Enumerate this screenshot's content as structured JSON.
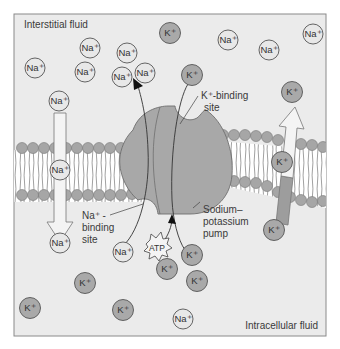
{
  "diagram": {
    "type": "sodium-potassium pump across cell membrane",
    "regions": {
      "top_label": "Interstitial fluid",
      "bottom_label": "Intracellular fluid"
    },
    "labels": {
      "k_binding_line1": "K⁺-binding",
      "k_binding_line2": "site",
      "na_binding_line1": "Na⁺ -",
      "na_binding_line2": "binding",
      "na_binding_line3": "site",
      "pump_line1": "Sodium–",
      "pump_line2": "potassium",
      "pump_line3": "pump",
      "atp": "ATP"
    },
    "ion_text": {
      "na": "Na⁺",
      "k": "K⁺"
    },
    "colors": {
      "background": "#ebebeb",
      "frame": "#8a8a8a",
      "na_fill": "#e8e8e8",
      "k_fill": "#a9a9a9",
      "pump_fill": "#a8a8a8",
      "lipid_head": "#a6a6a6",
      "arrow_light": "#f4f4f4",
      "arrow_dark": "#9d9d9d"
    },
    "ions": [
      {
        "type": "na",
        "x": 35,
        "y": 68
      },
      {
        "type": "na",
        "x": 90,
        "y": 48
      },
      {
        "type": "na",
        "x": 85,
        "y": 72
      },
      {
        "type": "na",
        "x": 127,
        "y": 53
      },
      {
        "type": "na",
        "x": 122,
        "y": 77
      },
      {
        "type": "na",
        "x": 145,
        "y": 73
      },
      {
        "type": "na",
        "x": 59,
        "y": 101
      },
      {
        "type": "k",
        "x": 170,
        "y": 33
      },
      {
        "type": "na",
        "x": 228,
        "y": 40
      },
      {
        "type": "na",
        "x": 269,
        "y": 50
      },
      {
        "type": "na",
        "x": 313,
        "y": 34
      },
      {
        "type": "k",
        "x": 192,
        "y": 75
      },
      {
        "type": "k",
        "x": 292,
        "y": 92
      },
      {
        "type": "na",
        "x": 60,
        "y": 170
      },
      {
        "type": "k",
        "x": 282,
        "y": 162
      },
      {
        "type": "na",
        "x": 60,
        "y": 243
      },
      {
        "type": "na",
        "x": 123,
        "y": 252
      },
      {
        "type": "k",
        "x": 274,
        "y": 230
      },
      {
        "type": "k",
        "x": 192,
        "y": 255
      },
      {
        "type": "k",
        "x": 167,
        "y": 269
      },
      {
        "type": "k",
        "x": 197,
        "y": 281
      },
      {
        "type": "k",
        "x": 85,
        "y": 283
      },
      {
        "type": "k",
        "x": 30,
        "y": 308
      },
      {
        "type": "k",
        "x": 123,
        "y": 310
      },
      {
        "type": "na",
        "x": 183,
        "y": 319
      }
    ]
  }
}
